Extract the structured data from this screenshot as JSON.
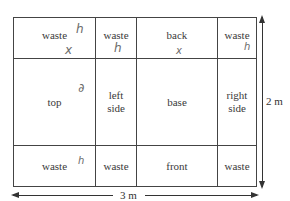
{
  "diagram": {
    "cells": {
      "r1c1": "waste",
      "r1c2": "waste",
      "r1c3": "back",
      "r1c4": "waste",
      "r2c1": "top",
      "r2c2": "left side",
      "r2c3": "base",
      "r2c4": "right side",
      "r3c1": "waste",
      "r3c2": "waste",
      "r3c3": "front",
      "r3c4": "waste"
    },
    "dimensions": {
      "height_label": "2 m",
      "width_label": "3 m"
    },
    "handwritten": {
      "r1c1_mark_a": "h",
      "r1c1_mark_b": "x",
      "r1c2_mark": "h",
      "r1c3_mark": "x",
      "r1c4_mark": "h",
      "r2c1_mark": "∂",
      "r3c1_mark": "h"
    }
  }
}
